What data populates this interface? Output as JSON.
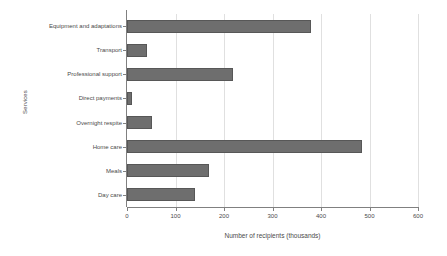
{
  "chart_data": {
    "type": "bar",
    "orientation": "horizontal",
    "title": "",
    "xlabel": "Number of recipients (thousands)",
    "ylabel": "Services",
    "categories": [
      "Equipment and adaptations",
      "Transport",
      "Professional support",
      "Direct payments",
      "Overnight respite",
      "Home care",
      "Meals",
      "Day care"
    ],
    "values": [
      380,
      42,
      218,
      10,
      52,
      485,
      170,
      140
    ],
    "xlim": [
      0,
      600
    ],
    "xticks": [
      0,
      100,
      200,
      300,
      400,
      500,
      600
    ],
    "xtick_labels": [
      "0",
      "100",
      "200",
      "300",
      "400",
      "500",
      "600"
    ],
    "grid": "vertical",
    "legend": "none",
    "bar_color": "#6e6e6e",
    "bar_edge_color": "#575757",
    "gridline_color": "#e0e0e0",
    "axis_color": "#808080",
    "background": "#ffffff"
  }
}
